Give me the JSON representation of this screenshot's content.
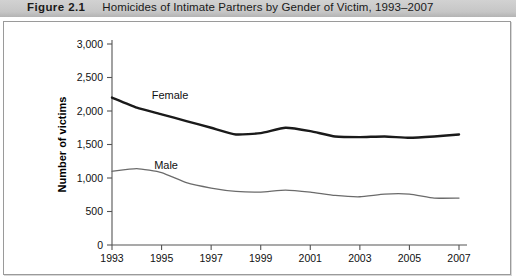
{
  "caption": {
    "number": "Figure 2.1",
    "text": "Homicides of Intimate Partners by Gender of Victim, 1993–2007"
  },
  "chart_data": {
    "type": "line",
    "title": "Homicides of Intimate Partners by Gender of Victim, 1993–2007",
    "xlabel": "",
    "ylabel": "Number of victims",
    "xlim": [
      1993,
      2007
    ],
    "ylim": [
      0,
      3000
    ],
    "grid": false,
    "legend": "inline-labels",
    "x": [
      1993,
      1994,
      1995,
      1996,
      1997,
      1998,
      1999,
      2000,
      2001,
      2002,
      2003,
      2004,
      2005,
      2006,
      2007
    ],
    "xtick_labels": [
      "1993",
      "1995",
      "1997",
      "1999",
      "2001",
      "2003",
      "2005",
      "2007"
    ],
    "xtick_values": [
      1993,
      1995,
      1997,
      1999,
      2001,
      2003,
      2005,
      2007
    ],
    "ytick_labels": [
      "0",
      "500",
      "1,000",
      "1,500",
      "2,000",
      "2,500",
      "3,000"
    ],
    "ytick_values": [
      0,
      500,
      1000,
      1500,
      2000,
      2500,
      3000
    ],
    "series": [
      {
        "name": "Female",
        "color": "#1a1a1a",
        "width": 2.4,
        "label_x": 1994.6,
        "label_y": 2180,
        "values": [
          2200,
          2050,
          1950,
          1850,
          1750,
          1650,
          1670,
          1750,
          1700,
          1620,
          1610,
          1620,
          1600,
          1620,
          1650
        ]
      },
      {
        "name": "Male",
        "color": "#6b6b6b",
        "width": 1.3,
        "label_x": 1994.7,
        "label_y": 1130,
        "values": [
          1100,
          1140,
          1080,
          930,
          850,
          800,
          790,
          820,
          790,
          740,
          720,
          760,
          760,
          700,
          700
        ]
      }
    ]
  }
}
